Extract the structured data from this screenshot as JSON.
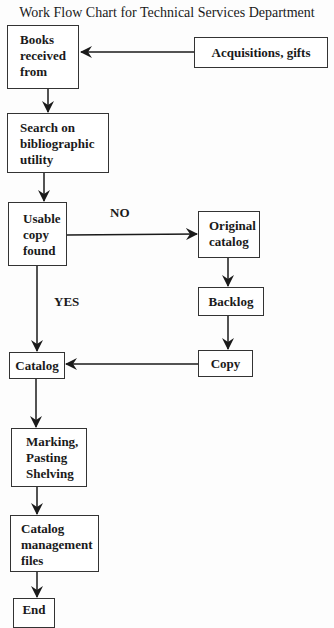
{
  "header": {
    "partial_title": "Figure: Technical Services Flow Diagram",
    "title": "Work Flow Chart for Technical Services Department"
  },
  "nodes": {
    "books_received": "Books received from",
    "acquisitions": "Acquisitions, gifts",
    "search": "Search on bibliographic utility",
    "usable_copy": "Usable copy found",
    "original_catalog": "Original catalog",
    "backlog": "Backlog",
    "copy": "Copy",
    "catalog": "Catalog",
    "marking": "Marking, Pasting Shelving",
    "catalog_mgmt": "Catalog management files",
    "end": "End"
  },
  "edge_labels": {
    "no": "NO",
    "yes": "YES"
  },
  "edges": [
    {
      "from": "acquisitions",
      "to": "books_received"
    },
    {
      "from": "books_received",
      "to": "search"
    },
    {
      "from": "search",
      "to": "usable_copy"
    },
    {
      "from": "usable_copy",
      "to": "original_catalog",
      "label": "NO"
    },
    {
      "from": "usable_copy",
      "to": "catalog",
      "label": "YES"
    },
    {
      "from": "original_catalog",
      "to": "backlog"
    },
    {
      "from": "backlog",
      "to": "copy"
    },
    {
      "from": "copy",
      "to": "catalog"
    },
    {
      "from": "catalog",
      "to": "marking"
    },
    {
      "from": "marking",
      "to": "catalog_mgmt"
    },
    {
      "from": "catalog_mgmt",
      "to": "end"
    }
  ]
}
